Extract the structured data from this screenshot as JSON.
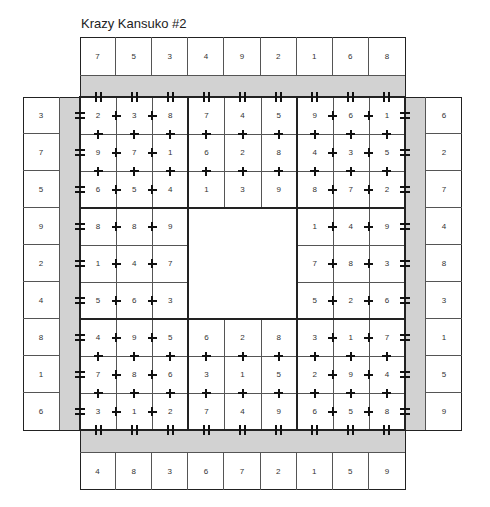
{
  "title": "Krazy Kansuko #2",
  "clues": {
    "top": [
      "7",
      "5",
      "3",
      "4",
      "9",
      "2",
      "1",
      "6",
      "8"
    ],
    "bottom": [
      "4",
      "8",
      "3",
      "6",
      "7",
      "2",
      "1",
      "5",
      "9"
    ],
    "left": [
      "3",
      "7",
      "5",
      "9",
      "2",
      "4",
      "8",
      "1",
      "6"
    ],
    "right": [
      "6",
      "2",
      "7",
      "4",
      "8",
      "3",
      "1",
      "5",
      "9"
    ]
  },
  "grid": [
    [
      "2",
      "3",
      "8",
      "7",
      "4",
      "5",
      "9",
      "6",
      "1"
    ],
    [
      "9",
      "7",
      "1",
      "6",
      "2",
      "8",
      "4",
      "3",
      "5"
    ],
    [
      "6",
      "5",
      "4",
      "1",
      "3",
      "9",
      "8",
      "7",
      "2"
    ],
    [
      "8",
      "8",
      "9",
      "",
      "",
      "",
      "1",
      "4",
      "9"
    ],
    [
      "1",
      "4",
      "7",
      "",
      "",
      "",
      "7",
      "8",
      "3"
    ],
    [
      "5",
      "6",
      "3",
      "",
      "",
      "",
      "5",
      "2",
      "6"
    ],
    [
      "4",
      "9",
      "5",
      "6",
      "2",
      "8",
      "3",
      "1",
      "7"
    ],
    [
      "7",
      "8",
      "6",
      "3",
      "1",
      "5",
      "2",
      "9",
      "4"
    ],
    [
      "3",
      "1",
      "2",
      "7",
      "4",
      "9",
      "6",
      "5",
      "8"
    ]
  ],
  "center_block_empty": true,
  "symbols": {
    "between_columns": "plus-sign",
    "between_rows": "plus-sign",
    "edge_left_right": "equals-sign",
    "edge_top_bottom": "double-bar"
  },
  "colors": {
    "band": "#d2d2d2",
    "line": "#222222"
  }
}
